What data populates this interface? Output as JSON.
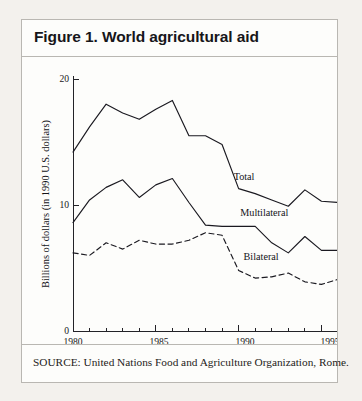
{
  "figure": {
    "title": "Figure 1. World agricultural aid",
    "source": "SOURCE: United Nations Food and Agriculture Organization, Rome."
  },
  "chart_data": {
    "type": "line",
    "title": "Figure 1. World agricultural aid",
    "xlabel": "",
    "ylabel": "Billions of dollars (in 1990 U.S. dollars)",
    "xlim": [
      1980,
      1996
    ],
    "ylim": [
      0,
      20
    ],
    "xticks": [
      1980,
      1985,
      1990,
      1995
    ],
    "xtick_labels": [
      "1980",
      "1985",
      "1990",
      "1995"
    ],
    "yticks": [
      0,
      10,
      20
    ],
    "ytick_labels": [
      "0",
      "10",
      "20"
    ],
    "grid": false,
    "legend": "inline-labels",
    "x": [
      1980,
      1981,
      1982,
      1983,
      1984,
      1985,
      1986,
      1987,
      1988,
      1989,
      1990,
      1991,
      1992,
      1993,
      1994,
      1995,
      1996
    ],
    "series": [
      {
        "name": "Total",
        "style": "solid",
        "label_x": 1989.7,
        "label_y": 12.0,
        "values": [
          14.2,
          16.2,
          18.0,
          17.3,
          16.8,
          17.6,
          18.3,
          15.5,
          15.5,
          14.8,
          11.3,
          10.9,
          10.4,
          9.9,
          11.2,
          10.3,
          10.2
        ]
      },
      {
        "name": "Multilateral",
        "style": "solid",
        "label_x": 1990.1,
        "label_y": 9.1,
        "values": [
          8.6,
          10.4,
          11.4,
          12.0,
          10.6,
          11.6,
          12.1,
          10.2,
          8.4,
          8.3,
          8.3,
          8.3,
          7.0,
          6.2,
          7.5,
          6.4,
          6.4
        ]
      },
      {
        "name": "Bilateral",
        "style": "dashed",
        "label_x": 1990.3,
        "label_y": 5.6,
        "values": [
          6.2,
          6.0,
          7.0,
          6.5,
          7.2,
          6.9,
          6.9,
          7.2,
          7.8,
          7.6,
          4.8,
          4.2,
          4.3,
          4.6,
          3.9,
          3.7,
          4.1
        ]
      }
    ]
  }
}
